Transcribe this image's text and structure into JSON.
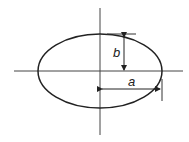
{
  "diagram": {
    "type": "ellipse-semi-axes",
    "labels": {
      "semi_major": "a",
      "semi_minor": "b"
    },
    "colors": {
      "stroke": "#222222",
      "background": "#ffffff"
    }
  }
}
